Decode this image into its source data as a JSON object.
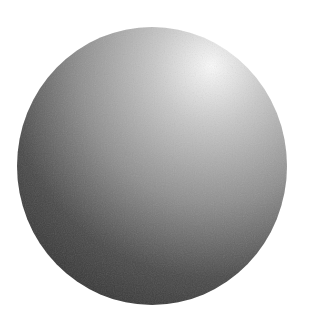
{
  "image": {
    "subject": "Shaded gray sphere",
    "description": "A matte gray sphere lit from the upper right, with a bright highlight near the top-right and darker shading toward the lower left.",
    "background_color": "#ffffff",
    "colors": {
      "highlight": "#fafafa",
      "light": "#c8c8c8",
      "mid": "#8e8e8e",
      "dark": "#4a4a4a",
      "darkest": "#353535"
    },
    "light_direction": "upper-right"
  }
}
